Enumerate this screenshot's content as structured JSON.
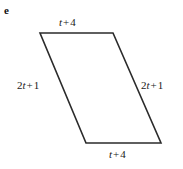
{
  "figure": {
    "part_label": "e",
    "type": "parallelogram",
    "background_color": "#ffffff",
    "stroke_color": "#2b2b2b",
    "stroke_width": 1.6,
    "vertices": {
      "top_left": [
        40,
        33
      ],
      "top_right": [
        113,
        33
      ],
      "bottom_right": [
        161,
        143
      ],
      "bottom_left": [
        86,
        143
      ]
    },
    "labels": {
      "top": {
        "coefficient": "",
        "variable": "t",
        "operator": "+",
        "constant": "4",
        "text": "t + 4"
      },
      "bottom": {
        "coefficient": "",
        "variable": "t",
        "operator": "+",
        "constant": "4",
        "text": "t + 4"
      },
      "left": {
        "coefficient": "2",
        "variable": "t",
        "operator": "+",
        "constant": "1",
        "text": "2t + 1"
      },
      "right": {
        "coefficient": "2",
        "variable": "t",
        "operator": "+",
        "constant": "1",
        "text": "2t + 1"
      }
    }
  }
}
